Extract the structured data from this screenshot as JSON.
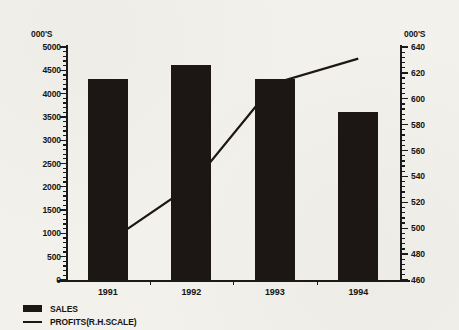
{
  "chart_data": {
    "type": "bar",
    "title": "",
    "xlabel": "",
    "ylabel": "000'S",
    "categories": [
      "1991",
      "1992",
      "1993",
      "1994"
    ],
    "grid": false,
    "legend_position": "bottom-left",
    "left_axis": {
      "unit_label": "000'S",
      "min": 0,
      "max": 5000,
      "step": 500,
      "minor_step": 100,
      "ticks": [
        "5000",
        "4500",
        "4000",
        "3500",
        "3000",
        "2500",
        "2000",
        "1500",
        "1000",
        "500",
        "0"
      ]
    },
    "right_axis": {
      "unit_label": "000'S",
      "min": 460,
      "max": 640,
      "step": 20,
      "minor_step": 4,
      "ticks": [
        "640",
        "620",
        "600",
        "580",
        "560",
        "540",
        "520",
        "500",
        "480",
        "460"
      ]
    },
    "series": [
      {
        "name": "SALES",
        "type": "bar",
        "axis": "left",
        "color": "#1c1714",
        "values": [
          4320,
          4620,
          4310,
          3600
        ]
      },
      {
        "name": "PROFITS(R.H.SCALE)",
        "type": "line",
        "axis": "right",
        "color": "#1c1714",
        "values": [
          489,
          533,
          612,
          631
        ]
      }
    ]
  },
  "legend": {
    "items": [
      {
        "label": "SALES",
        "marker": "filled-rect"
      },
      {
        "label": "PROFITS(R.H.SCALE)",
        "marker": "line"
      }
    ]
  }
}
